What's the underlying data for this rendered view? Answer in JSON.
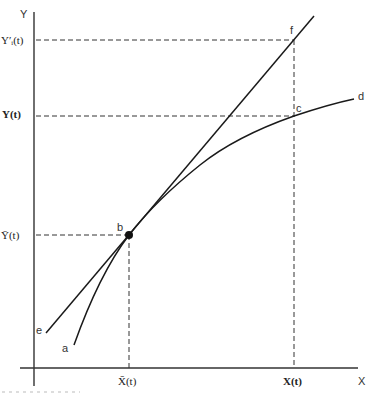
{
  "diagram": {
    "axes": {
      "x_label": "X",
      "y_label": "Y"
    },
    "y_ticks": {
      "y_prime": "Y′ᵢ(t)",
      "y_t": "Y(t)",
      "y_bar": "Ȳ(t)"
    },
    "x_ticks": {
      "x_bar": "X̄(t)",
      "x_t": "X(t)"
    },
    "points": {
      "a": "a",
      "b": "b",
      "c": "c",
      "d": "d",
      "e": "e",
      "f": "f"
    },
    "elements": [
      {
        "id": "curve-ad",
        "type": "concave-curve",
        "from": "a",
        "through": [
          "b",
          "c"
        ],
        "to": "d"
      },
      {
        "id": "tangent-ef",
        "type": "straight-line",
        "from": "e",
        "through": [
          "b",
          "f"
        ],
        "note": "tangent to curve at b"
      },
      {
        "id": "point-b",
        "type": "marker",
        "at": "b"
      }
    ],
    "colors": {
      "ink": "#1a1a1a",
      "axis": "#333333",
      "background": "#ffffff"
    }
  }
}
